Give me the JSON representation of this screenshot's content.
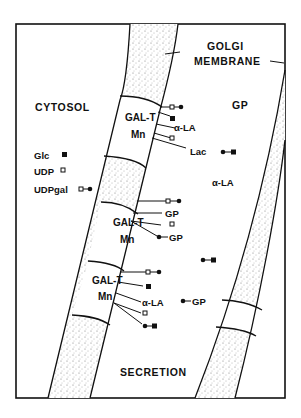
{
  "diagram": {
    "regions": {
      "cytosol": "CYTOSOL",
      "golgi_membrane": [
        "GOLGI",
        "MEMBRANE"
      ],
      "lumen": "GP",
      "secretion": "SECRETION"
    },
    "legend": {
      "glc": "Glc",
      "udp": "UDP",
      "udpgal": "UDPgal"
    },
    "enzymes": [
      {
        "name": "GAL-T",
        "cofactor": "Mn"
      },
      {
        "name": "GAL-T",
        "cofactor": "Mn"
      },
      {
        "name": "GAL-T",
        "cofactor": "Mn"
      }
    ],
    "labels": {
      "la_1": "α-LA",
      "lac": "Lac",
      "la_free": "α-LA",
      "gp_2": "GP",
      "gp_2b": "GP",
      "la_3": "α-LA",
      "gp_3": "GP"
    },
    "colors": {
      "line": "#111111",
      "stipple": "#555555",
      "background": "#ffffff"
    }
  }
}
